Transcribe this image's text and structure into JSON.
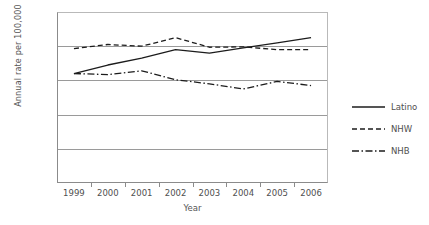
{
  "chart_data": {
    "type": "line",
    "title": "",
    "xlabel": "Year",
    "ylabel": "Annual rate per 100,000",
    "categories": [
      "1999",
      "2000",
      "2001",
      "2002",
      "2003",
      "2004",
      "2005",
      "2006"
    ],
    "x": [
      1999,
      2000,
      2001,
      2002,
      2003,
      2004,
      2005,
      2006
    ],
    "ylim": [
      0,
      50
    ],
    "yticks": [
      "0",
      "10",
      "20",
      "30",
      "40",
      "50"
    ],
    "ytick_values": [
      0,
      10,
      20,
      30,
      40,
      50
    ],
    "grid": true,
    "legend_position": "right",
    "series": [
      {
        "name": "Latino",
        "style": "solid",
        "color": "#1c1c1c",
        "values": [
          32.0,
          34.5,
          36.5,
          39.0,
          38.0,
          39.5,
          41.0,
          42.5
        ]
      },
      {
        "name": "NHW",
        "style": "dashed",
        "color": "#1c1c1c",
        "values": [
          39.3,
          40.5,
          40.0,
          42.5,
          39.7,
          39.8,
          39.0,
          39.0
        ]
      },
      {
        "name": "NHB",
        "style": "dash-dot",
        "color": "#1c1c1c",
        "values": [
          32.0,
          31.7,
          32.8,
          30.2,
          29.0,
          27.5,
          29.7,
          28.5
        ]
      }
    ]
  },
  "legend": {
    "entries": [
      {
        "label": "Latino"
      },
      {
        "label": "NHW"
      },
      {
        "label": "NHB"
      }
    ]
  }
}
